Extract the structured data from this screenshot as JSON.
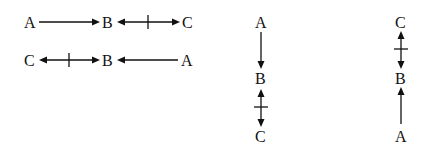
{
  "diagrams": [
    {
      "orientation": "horizontal",
      "nodes": [
        {
          "label": "A"
        },
        {
          "label": "B"
        },
        {
          "label": "C"
        }
      ],
      "edges": [
        {
          "from": "A",
          "to": "B",
          "type": "single-arrow"
        },
        {
          "from": "B",
          "to": "C",
          "type": "double-arrow-crossed"
        }
      ]
    },
    {
      "orientation": "horizontal",
      "nodes": [
        {
          "label": "C"
        },
        {
          "label": "B"
        },
        {
          "label": "A"
        }
      ],
      "edges": [
        {
          "from": "C",
          "to": "B",
          "type": "double-arrow-crossed"
        },
        {
          "from": "A",
          "to": "B",
          "type": "single-arrow"
        }
      ]
    },
    {
      "orientation": "vertical",
      "nodes": [
        {
          "label": "A"
        },
        {
          "label": "B"
        },
        {
          "label": "C"
        }
      ],
      "edges": [
        {
          "from": "A",
          "to": "B",
          "type": "single-arrow"
        },
        {
          "from": "B",
          "to": "C",
          "type": "double-arrow-crossed"
        }
      ]
    },
    {
      "orientation": "vertical",
      "nodes": [
        {
          "label": "C"
        },
        {
          "label": "B"
        },
        {
          "label": "A"
        }
      ],
      "edges": [
        {
          "from": "C",
          "to": "B",
          "type": "double-arrow-crossed"
        },
        {
          "from": "A",
          "to": "B",
          "type": "single-arrow"
        }
      ]
    }
  ]
}
